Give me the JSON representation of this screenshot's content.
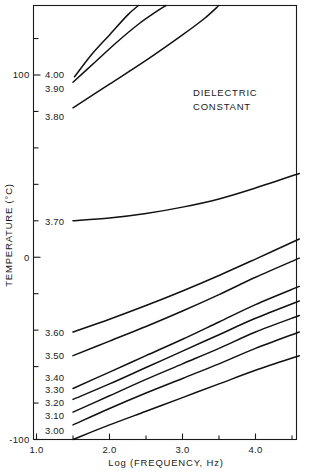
{
  "chart_data": {
    "type": "line",
    "title": "",
    "annotation": "DIELECTRIC\nCONSTANT",
    "annotation_line1": "DIELECTRIC",
    "annotation_line2": "CONSTANT",
    "xlabel": "Log (FREQUENCY, Hz)",
    "ylabel": "TEMPERATURE (°C)",
    "xlim": [
      0.85,
      4.62
    ],
    "ylim": [
      -100,
      140
    ],
    "xticks": [
      1.0,
      2.0,
      3.0,
      4.0
    ],
    "xtick_labels": [
      "1.0",
      "2.0",
      "3.0",
      "4.0"
    ],
    "yticks": [
      -100,
      -80,
      -60,
      -40,
      -20,
      0,
      20,
      40,
      60,
      80,
      100,
      120,
      140
    ],
    "ytick_labels_shown": [
      "100",
      "0",
      "-100"
    ],
    "ytick_labeled_values": [
      100,
      0,
      -100
    ],
    "grid": false,
    "legend": "none",
    "series_label_position": "left-inline",
    "series": [
      {
        "name": "3.00",
        "label": "3.00",
        "x": [
          1.5,
          2.0,
          2.5,
          3.0,
          3.5,
          4.0,
          4.6
        ],
        "y": [
          -100.0,
          -92.0,
          -84.5,
          -77.0,
          -69.5,
          -62.0,
          -54.0
        ]
      },
      {
        "name": "3.10",
        "label": "3.10",
        "x": [
          1.5,
          2.0,
          2.5,
          3.0,
          3.5,
          4.0,
          4.6
        ],
        "y": [
          -92.0,
          -83.0,
          -74.5,
          -66.5,
          -58.5,
          -50.0,
          -41.0
        ]
      },
      {
        "name": "3.20",
        "label": "3.20",
        "x": [
          1.5,
          2.0,
          2.5,
          3.0,
          3.5,
          4.0,
          4.6
        ],
        "y": [
          -85.0,
          -76.0,
          -67.0,
          -58.5,
          -50.0,
          -41.0,
          -32.0
        ]
      },
      {
        "name": "3.30",
        "label": "3.30",
        "x": [
          1.5,
          2.0,
          2.5,
          3.0,
          3.5,
          4.0,
          4.6
        ],
        "y": [
          -78.0,
          -69.5,
          -60.5,
          -51.5,
          -42.5,
          -33.5,
          -24.0
        ]
      },
      {
        "name": "3.40",
        "label": "3.40",
        "x": [
          1.5,
          2.0,
          2.5,
          3.0,
          3.5,
          4.0,
          4.6
        ],
        "y": [
          -72.0,
          -63.0,
          -54.0,
          -45.0,
          -35.5,
          -26.0,
          -16.0
        ]
      },
      {
        "name": "3.50",
        "label": "3.50",
        "x": [
          1.5,
          2.0,
          2.5,
          3.0,
          3.5,
          4.0,
          4.6
        ],
        "y": [
          -54.0,
          -46.0,
          -38.0,
          -29.5,
          -20.5,
          -11.0,
          -0.5
        ]
      },
      {
        "name": "3.60",
        "label": "3.60",
        "x": [
          1.5,
          2.0,
          2.5,
          3.0,
          3.5,
          4.0,
          4.6
        ],
        "y": [
          -41.0,
          -34.0,
          -26.5,
          -18.5,
          -10.0,
          -1.0,
          10.0
        ]
      },
      {
        "name": "3.70",
        "label": "3.70",
        "x": [
          1.5,
          2.0,
          2.5,
          3.0,
          3.5,
          4.0,
          4.6
        ],
        "y": [
          20.0,
          21.5,
          24.0,
          27.5,
          32.0,
          38.0,
          46.0
        ]
      },
      {
        "name": "3.80",
        "label": "3.80",
        "x": [
          1.5,
          2.0,
          2.5,
          3.0,
          3.3,
          3.55
        ],
        "y": [
          82.0,
          95.0,
          108.0,
          122.0,
          131.0,
          140.0
        ]
      },
      {
        "name": "3.90",
        "label": "3.90",
        "x": [
          1.5,
          1.8,
          2.1,
          2.4,
          2.65,
          2.85
        ],
        "y": [
          96.0,
          107.0,
          118.0,
          128.0,
          135.0,
          140.0
        ]
      },
      {
        "name": "4.00",
        "label": "4.00",
        "x": [
          1.52,
          1.75,
          2.0,
          2.25,
          2.45
        ],
        "y": [
          99.0,
          111.0,
          122.0,
          133.0,
          140.0
        ]
      }
    ]
  },
  "labels": {
    "contours": [
      {
        "text": "4.00",
        "x": 45,
        "y": 78
      },
      {
        "text": "3.90",
        "x": 45,
        "y": 92
      },
      {
        "text": "3.80",
        "x": 45,
        "y": 120
      },
      {
        "text": "3.70",
        "x": 45,
        "y": 225
      },
      {
        "text": "3.60",
        "x": 45,
        "y": 336
      },
      {
        "text": "3.50",
        "x": 45,
        "y": 359
      },
      {
        "text": "3.40",
        "x": 45,
        "y": 381
      },
      {
        "text": "3.30",
        "x": 45,
        "y": 393
      },
      {
        "text": "3.20",
        "x": 45,
        "y": 406
      },
      {
        "text": "3.10",
        "x": 45,
        "y": 419
      },
      {
        "text": "3.00",
        "x": 45,
        "y": 434
      }
    ]
  }
}
